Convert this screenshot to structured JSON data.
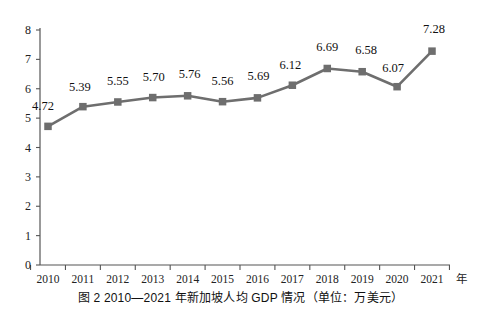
{
  "chart_data": {
    "type": "line",
    "title": "",
    "xlabel": "年",
    "ylabel": "",
    "categories": [
      "2010",
      "2011",
      "2012",
      "2013",
      "2014",
      "2015",
      "2016",
      "2017",
      "2018",
      "2019",
      "2020",
      "2021"
    ],
    "values": [
      4.72,
      5.39,
      5.55,
      5.7,
      5.76,
      5.56,
      5.69,
      6.12,
      6.69,
      6.58,
      6.07,
      7.28
    ],
    "point_labels": [
      "4.72",
      "5.39",
      "5.55",
      "5.70",
      "5.76",
      "5.56",
      "5.69",
      "6.12",
      "6.69",
      "6.58",
      "6.07",
      "7.28"
    ],
    "ylim": [
      0,
      8
    ],
    "yticks": [
      0,
      1,
      2,
      3,
      4,
      5,
      6,
      7,
      8
    ],
    "ytick_labels": [
      "0",
      "1",
      "2",
      "3",
      "4",
      "5",
      "6",
      "7",
      "8"
    ],
    "grid": false,
    "legend": "none",
    "series_color": "#6e6e6e",
    "axis_color": "#555555",
    "marker": "square"
  },
  "caption": {
    "text": "图 2   2010—2021 年新加坡人均 GDP 情况（单位：万美元）"
  },
  "axis": {
    "x_unit": "年"
  }
}
